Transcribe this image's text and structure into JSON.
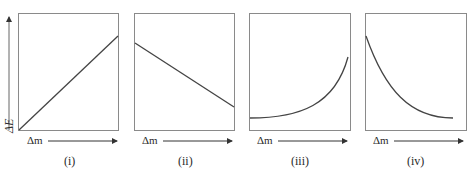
{
  "figure": {
    "y_axis_label": "ΔE",
    "panels": [
      {
        "id": "i",
        "label": "(i)",
        "x_label": "Δm",
        "curve": "linear-increasing"
      },
      {
        "id": "ii",
        "label": "(ii)",
        "x_label": "Δm",
        "curve": "linear-decreasing"
      },
      {
        "id": "iii",
        "label": "(iii)",
        "x_label": "Δm",
        "curve": "convex-increasing"
      },
      {
        "id": "iv",
        "label": "(iv)",
        "x_label": "Δm",
        "curve": "convex-decreasing"
      }
    ],
    "colors": {
      "line": "#444444",
      "frame": "#8a8a8a",
      "text": "#2a2a2a"
    }
  }
}
